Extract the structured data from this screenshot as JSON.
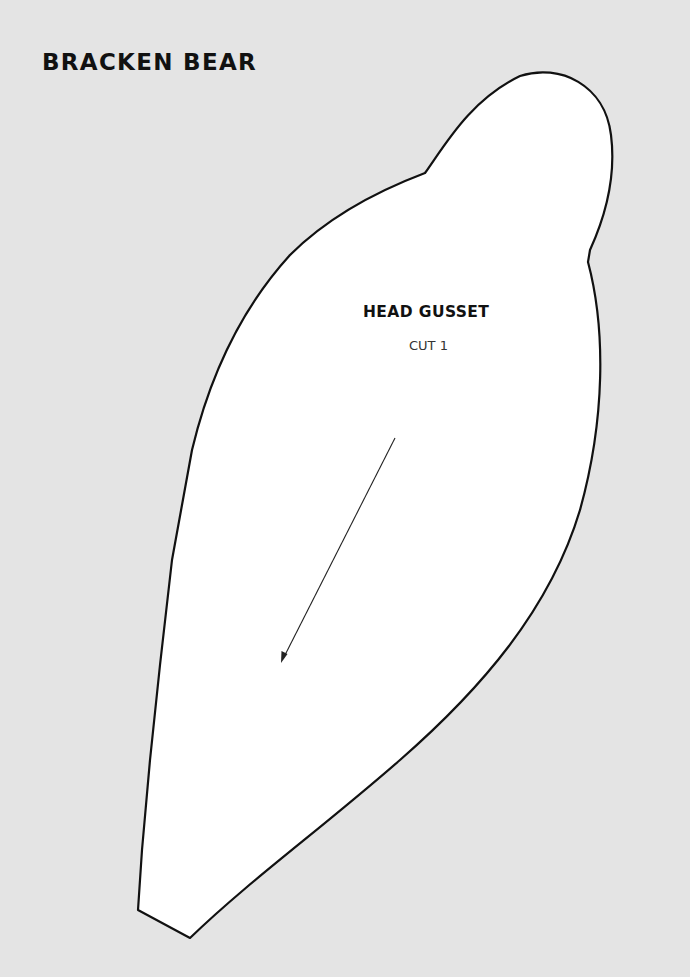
{
  "document": {
    "title": "BRACKEN BEAR",
    "background_color": "#e4e4e4"
  },
  "pattern_piece": {
    "name": "HEAD GUSSET",
    "instruction": "CUT 1",
    "fill_color": "#ffffff",
    "outline_color": "#111111",
    "grainline": {
      "from": [
        395,
        438
      ],
      "to": [
        282,
        662
      ],
      "direction": "down-left",
      "arrowhead": "end"
    }
  }
}
